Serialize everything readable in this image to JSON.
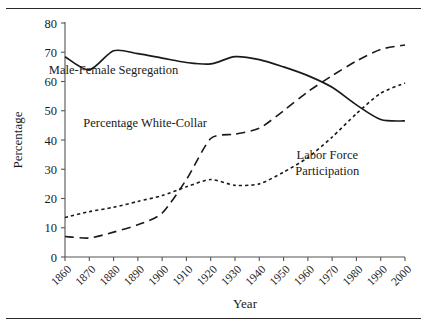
{
  "figure": {
    "has_top_rule": true,
    "has_bottom_rule": true,
    "background": "#ffffff",
    "ink_color": "#1a1a1a"
  },
  "chart_data": {
    "type": "line",
    "title": "",
    "xlabel": "Year",
    "ylabel": "Percentage",
    "xlim": [
      1860,
      2000
    ],
    "ylim": [
      0,
      80
    ],
    "grid": false,
    "legend_position": "inline-annotations",
    "x": [
      1860,
      1870,
      1880,
      1890,
      1900,
      1910,
      1920,
      1930,
      1940,
      1950,
      1960,
      1970,
      1980,
      1990,
      2000
    ],
    "xtick_labels": [
      "1860",
      "1870",
      "1880",
      "1890",
      "1900",
      "1910",
      "1920",
      "1930",
      "1940",
      "1950",
      "1960",
      "1970",
      "1980",
      "1990",
      "2000"
    ],
    "ytick_labels": [
      "0",
      "10",
      "20",
      "30",
      "40",
      "50",
      "60",
      "70",
      "80"
    ],
    "ytick_values": [
      0,
      10,
      20,
      30,
      40,
      50,
      60,
      70,
      80
    ],
    "series": [
      {
        "name": "Male-Female Segregation",
        "style": "solid",
        "values": [
          68.5,
          64.0,
          70.5,
          69.5,
          68.0,
          66.5,
          66.0,
          68.5,
          67.5,
          65.0,
          62.0,
          58.0,
          52.0,
          47.0,
          46.5
        ]
      },
      {
        "name": "Percentage White-Collar",
        "style": "long-dashed",
        "values": [
          7.0,
          6.5,
          8.5,
          11.0,
          15.0,
          26.5,
          40.5,
          42.0,
          44.0,
          50.0,
          56.5,
          62.0,
          67.0,
          71.0,
          72.5
        ]
      },
      {
        "name": "Labor Force Participation",
        "style": "dotted",
        "values": [
          13.5,
          15.5,
          17.0,
          19.0,
          21.0,
          24.0,
          26.5,
          24.5,
          25.0,
          29.0,
          34.0,
          41.0,
          49.0,
          56.0,
          59.5
        ]
      }
    ],
    "annotations": [
      {
        "text": "Male-Female Segregation",
        "x": 1880,
        "y": 62.5
      },
      {
        "text": "Percentage White-Collar",
        "x": 1893,
        "y": 44.5
      },
      {
        "text": "Labor Force",
        "x": 1968,
        "y": 33.5
      },
      {
        "text": "Participation",
        "x": 1968,
        "y": 28.0
      }
    ]
  }
}
